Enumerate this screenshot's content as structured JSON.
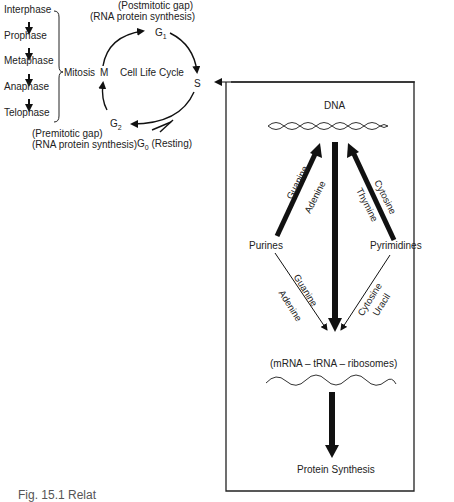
{
  "mitosis_phases": [
    "Interphase",
    "Prophase",
    "Metaphase",
    "Anaphase",
    "Telophase"
  ],
  "mitosis_label": "Mitosis",
  "cell_cycle": {
    "center_label": "Cell Life Cycle",
    "nodes": {
      "M": "M",
      "G1": "G",
      "G1_sub": "1",
      "S": "S",
      "G2": "G",
      "G2_sub": "2",
      "G0": "G",
      "G0_sub": "0",
      "G0_note": "(Resting)"
    },
    "postmitotic_line1": "(Postmitotic gap)",
    "postmitotic_line2": "(RNA protein synthesis)",
    "premitotic_line1": "(Premitotic gap)",
    "premitotic_line2": "(RNA protein synthesis)"
  },
  "box": {
    "dna_label": "DNA",
    "purines_label": "Purines",
    "pyrimidines_label": "Pyrimidines",
    "purines_to_dna": [
      "Guanine",
      "Adenine"
    ],
    "pyrimidines_to_dna": [
      "Cytosine",
      "Thymine"
    ],
    "purines_to_rna": [
      "Guanine",
      "Adenine"
    ],
    "pyrimidines_to_rna": [
      "Cytosine",
      "Uracil"
    ],
    "rna_label": "(mRNA – tRNA – ribosomes)",
    "protein_label": "Protein Synthesis"
  },
  "caption": "Fig. 15.1   Relat"
}
